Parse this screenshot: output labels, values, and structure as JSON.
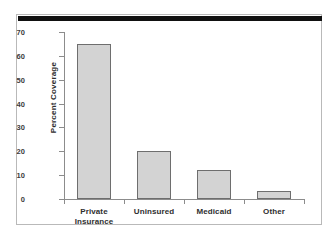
{
  "chart_data": {
    "type": "bar",
    "title": "",
    "xlabel": "",
    "ylabel": "Percent Coverage",
    "categories": [
      "Private Insurance",
      "Uninsured",
      "Medicaid",
      "Other"
    ],
    "category_lines": [
      [
        "Private",
        "Insurance"
      ],
      [
        "Uninsured"
      ],
      [
        "Medicaid"
      ],
      [
        "Other"
      ]
    ],
    "values": [
      65,
      20.2,
      12.3,
      3.5
    ],
    "ylim": [
      0,
      70
    ],
    "yticks": [
      0,
      10,
      20,
      30,
      40,
      50,
      60,
      70
    ],
    "ytick_labels": [
      "0",
      "10",
      "20",
      "30",
      "40",
      "50",
      "60",
      "70"
    ],
    "grid": false,
    "legend": null,
    "bar_fill_color": "#d3d3d3",
    "bar_edge_color": "#6e6e6e",
    "axis_color": "#8c8c8c",
    "text_color": "#2e2e2e",
    "frame_border_color": "#b9b9b9",
    "top_rule_color": "#111111"
  }
}
